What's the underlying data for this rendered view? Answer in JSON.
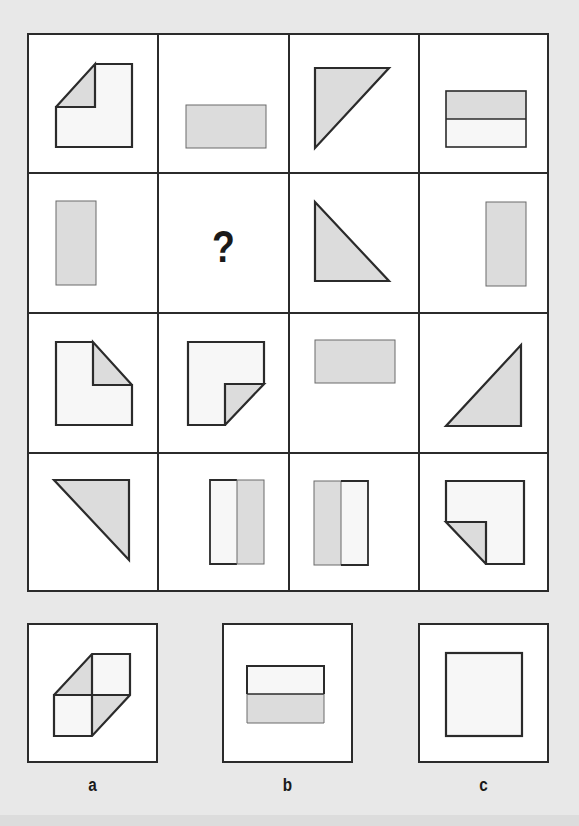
{
  "puzzle": {
    "instruction_fragment": "...",
    "missing_marker": "?",
    "colors": {
      "background": "#e8e8e8",
      "line": "#2b2b2b",
      "shape_fill_light": "#f7f7f7",
      "shape_fill_grey": "#dcdcdc"
    },
    "grid": {
      "rows": 4,
      "cols": 4,
      "cells": [
        [
          "folded-square-top-left",
          "grey-rectangle-horizontal",
          "grey-triangle-top-left",
          "split-rectangle-grey-top"
        ],
        [
          "grey-rectangle-vertical-left",
          "?",
          "grey-triangle-bottom-left",
          "grey-rectangle-vertical-right"
        ],
        [
          "folded-square-top-right",
          "folded-square-bottom-right",
          "grey-rectangle-horizontal-top",
          "grey-triangle-bottom-right"
        ],
        [
          "grey-triangle-top-right",
          "split-rectangle-grey-right",
          "split-rectangle-grey-left",
          "folded-square-bottom-left"
        ]
      ]
    },
    "options": [
      {
        "label": "a",
        "shape": "double-folded-square"
      },
      {
        "label": "b",
        "shape": "split-rectangle-grey-bottom"
      },
      {
        "label": "c",
        "shape": "plain-square"
      }
    ]
  }
}
